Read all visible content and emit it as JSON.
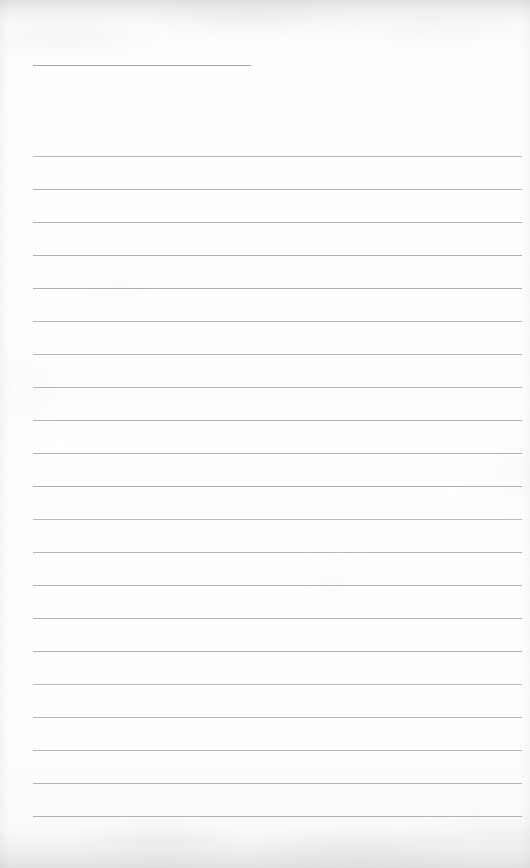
{
  "document": {
    "kind": "blank-ruled-notepaper-scan",
    "title": "",
    "body_text": "",
    "page_width": 530,
    "page_height": 868,
    "background_color": "#fdfdfd",
    "rule_color": "#a9a9b0",
    "header_rule_color": "#9e9ea6"
  },
  "header": {
    "rule": {
      "label": "title-rule",
      "x": 33,
      "y": 65,
      "width": 218,
      "height": 1
    },
    "written_text": ""
  },
  "body": {
    "left_margin": 33,
    "right_margin": 8,
    "first_rule_y": 156,
    "line_spacing": 33,
    "rule_count": 21,
    "rules": [
      {
        "index": 1,
        "y": 156,
        "x": 33,
        "width": 489,
        "text": ""
      },
      {
        "index": 2,
        "y": 189,
        "x": 33,
        "width": 489,
        "text": ""
      },
      {
        "index": 3,
        "y": 222,
        "x": 33,
        "width": 489,
        "text": ""
      },
      {
        "index": 4,
        "y": 255,
        "x": 33,
        "width": 489,
        "text": ""
      },
      {
        "index": 5,
        "y": 288,
        "x": 33,
        "width": 489,
        "text": ""
      },
      {
        "index": 6,
        "y": 321,
        "x": 33,
        "width": 489,
        "text": ""
      },
      {
        "index": 7,
        "y": 354,
        "x": 33,
        "width": 489,
        "text": ""
      },
      {
        "index": 8,
        "y": 387,
        "x": 33,
        "width": 489,
        "text": ""
      },
      {
        "index": 9,
        "y": 420,
        "x": 33,
        "width": 489,
        "text": ""
      },
      {
        "index": 10,
        "y": 453,
        "x": 33,
        "width": 489,
        "text": ""
      },
      {
        "index": 11,
        "y": 486,
        "x": 33,
        "width": 489,
        "text": ""
      },
      {
        "index": 12,
        "y": 519,
        "x": 33,
        "width": 489,
        "text": ""
      },
      {
        "index": 13,
        "y": 552,
        "x": 33,
        "width": 489,
        "text": ""
      },
      {
        "index": 14,
        "y": 585,
        "x": 33,
        "width": 489,
        "text": ""
      },
      {
        "index": 15,
        "y": 618,
        "x": 33,
        "width": 489,
        "text": ""
      },
      {
        "index": 16,
        "y": 651,
        "x": 33,
        "width": 489,
        "text": ""
      },
      {
        "index": 17,
        "y": 684,
        "x": 33,
        "width": 489,
        "text": ""
      },
      {
        "index": 18,
        "y": 717,
        "x": 33,
        "width": 489,
        "text": ""
      },
      {
        "index": 19,
        "y": 750,
        "x": 33,
        "width": 489,
        "text": ""
      },
      {
        "index": 20,
        "y": 783,
        "x": 33,
        "width": 489,
        "text": ""
      },
      {
        "index": 21,
        "y": 816,
        "x": 33,
        "width": 489,
        "text": ""
      }
    ]
  },
  "footer": {
    "text": "",
    "page_number": ""
  }
}
